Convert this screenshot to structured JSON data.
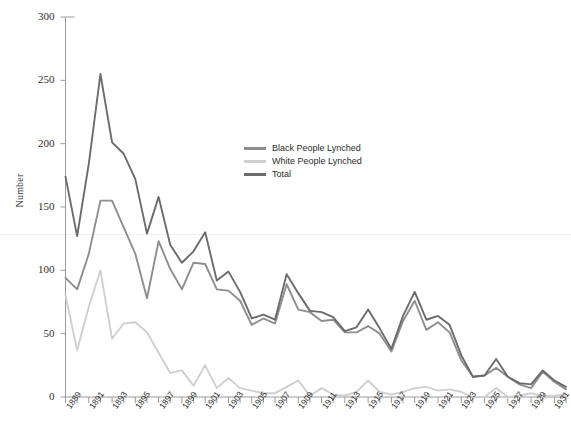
{
  "chart_data": {
    "type": "line",
    "title": "",
    "xlabel": "",
    "ylabel": "Number",
    "ylim": [
      0,
      300
    ],
    "yticks": [
      0,
      50,
      100,
      150,
      200,
      250,
      300
    ],
    "xlim": [
      1889,
      1932
    ],
    "grid": false,
    "legend_position": "upper-center",
    "x": [
      1889,
      1890,
      1891,
      1892,
      1893,
      1894,
      1895,
      1896,
      1897,
      1898,
      1899,
      1900,
      1901,
      1902,
      1903,
      1904,
      1905,
      1906,
      1907,
      1908,
      1909,
      1910,
      1911,
      1912,
      1913,
      1914,
      1915,
      1916,
      1917,
      1918,
      1919,
      1920,
      1921,
      1922,
      1923,
      1924,
      1925,
      1926,
      1927,
      1928,
      1929,
      1930,
      1931,
      1932
    ],
    "xtick_labels": [
      "1889",
      "1891",
      "1893",
      "1895",
      "1897",
      "1899",
      "1901",
      "1903",
      "1905",
      "1907",
      "1909",
      "1911",
      "1913",
      "1915",
      "1917",
      "1919",
      "1921",
      "1923",
      "1925",
      "1927",
      "1929",
      "1931"
    ],
    "xtick_values": [
      1889,
      1891,
      1893,
      1895,
      1897,
      1899,
      1901,
      1903,
      1905,
      1907,
      1909,
      1911,
      1913,
      1915,
      1917,
      1919,
      1921,
      1923,
      1925,
      1927,
      1929,
      1931
    ],
    "series": [
      {
        "name": "Black People Lynched",
        "color": "#8e8e8e",
        "values": [
          94,
          85,
          113,
          155,
          155,
          134,
          113,
          78,
          123,
          101,
          85,
          106,
          105,
          85,
          84,
          76,
          57,
          62,
          58,
          89,
          69,
          67,
          60,
          61,
          51,
          51,
          56,
          50,
          36,
          60,
          76,
          53,
          59,
          51,
          29,
          16,
          17,
          23,
          16,
          10,
          7,
          20,
          12,
          6
        ]
      },
      {
        "name": "White People Lynched",
        "color": "#cfcfcf",
        "values": [
          80,
          37,
          71,
          100,
          46,
          58,
          59,
          51,
          35,
          19,
          21,
          9,
          25,
          7,
          15,
          7,
          5,
          3,
          3,
          8,
          13,
          1,
          7,
          2,
          1,
          4,
          13,
          4,
          2,
          4,
          7,
          8,
          5,
          6,
          4,
          0,
          0,
          7,
          0,
          1,
          3,
          1,
          1,
          2
        ]
      },
      {
        "name": "Total",
        "color": "#6b6b6b",
        "values": [
          174,
          127,
          184,
          255,
          201,
          192,
          172,
          129,
          158,
          120,
          106,
          115,
          130,
          92,
          99,
          83,
          62,
          65,
          61,
          97,
          82,
          68,
          67,
          63,
          52,
          55,
          69,
          54,
          38,
          64,
          83,
          61,
          64,
          57,
          33,
          16,
          17,
          30,
          16,
          11,
          10,
          21,
          13,
          8
        ]
      }
    ]
  },
  "axes": {
    "y_title": "Number",
    "axis_color": "#9a9a9a"
  }
}
